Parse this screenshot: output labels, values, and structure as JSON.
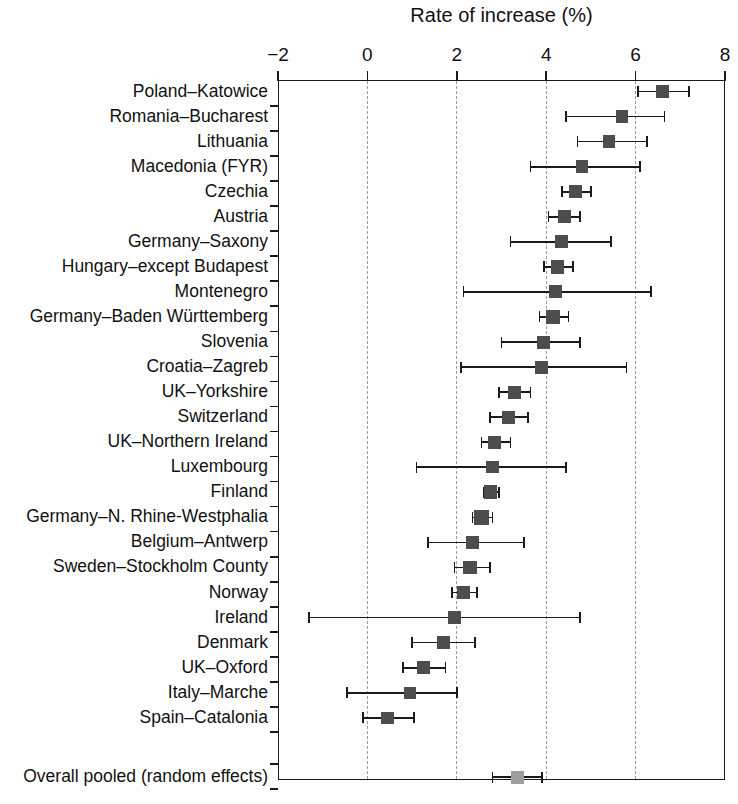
{
  "chart_data": {
    "type": "scatter",
    "subtype": "forest-plot",
    "title": "Rate of increase (%)",
    "xlabel": "Rate of increase (%)",
    "ylabel": "",
    "xlim": [
      -2,
      8
    ],
    "xticks": [
      -2,
      0,
      2,
      4,
      6,
      8
    ],
    "xticklabels": [
      "−2",
      "0",
      "2",
      "4",
      "6",
      "8"
    ],
    "grid": "vertical-dashed",
    "legend": "none",
    "axis_position": "top",
    "categories": [
      "Poland–Katowice",
      "Romania–Bucharest",
      "Lithuania",
      "Macedonia (FYR)",
      "Czechia",
      "Austria",
      "Germany–Saxony",
      "Hungary–except Budapest",
      "Montenegro",
      "Germany–Baden Württemberg",
      "Slovenia",
      "Croatia–Zagreb",
      "UK–Yorkshire",
      "Switzerland",
      "UK–Northern Ireland",
      "Luxembourg",
      "Finland",
      "Germany–N. Rhine-Westphalia",
      "Belgium–Antwerp",
      "Sweden–Stockholm County",
      "Norway",
      "Ireland",
      "Denmark",
      "UK–Oxford",
      "Italy–Marche",
      "Spain–Catalonia"
    ],
    "summary_label": "Overall pooled (random effects)",
    "points": [
      {
        "label": "Poland–Katowice",
        "estimate": 6.6,
        "ci_low": 6.05,
        "ci_high": 7.2,
        "weight": 1.0
      },
      {
        "label": "Romania–Bucharest",
        "estimate": 5.7,
        "ci_low": 4.45,
        "ci_high": 6.65,
        "weight": 0.95
      },
      {
        "label": "Lithuania",
        "estimate": 5.4,
        "ci_low": 4.7,
        "ci_high": 6.25,
        "weight": 0.95
      },
      {
        "label": "Macedonia (FYR)",
        "estimate": 4.8,
        "ci_low": 3.65,
        "ci_high": 6.1,
        "weight": 0.95
      },
      {
        "label": "Czechia",
        "estimate": 4.65,
        "ci_low": 4.35,
        "ci_high": 5.0,
        "weight": 1.0
      },
      {
        "label": "Austria",
        "estimate": 4.4,
        "ci_low": 4.05,
        "ci_high": 4.75,
        "weight": 1.0
      },
      {
        "label": "Germany–Saxony",
        "estimate": 4.35,
        "ci_low": 3.2,
        "ci_high": 5.45,
        "weight": 1.0
      },
      {
        "label": "Hungary–except Budapest",
        "estimate": 4.25,
        "ci_low": 3.95,
        "ci_high": 4.6,
        "weight": 1.05
      },
      {
        "label": "Montenegro",
        "estimate": 4.2,
        "ci_low": 2.15,
        "ci_high": 6.35,
        "weight": 1.0
      },
      {
        "label": "Germany–Baden Württemberg",
        "estimate": 4.15,
        "ci_low": 3.85,
        "ci_high": 4.5,
        "weight": 1.05
      },
      {
        "label": "Slovenia",
        "estimate": 3.95,
        "ci_low": 3.0,
        "ci_high": 4.75,
        "weight": 1.0
      },
      {
        "label": "Croatia–Zagreb",
        "estimate": 3.9,
        "ci_low": 2.1,
        "ci_high": 5.8,
        "weight": 1.0
      },
      {
        "label": "UK–Yorkshire",
        "estimate": 3.3,
        "ci_low": 2.95,
        "ci_high": 3.65,
        "weight": 1.0
      },
      {
        "label": "Switzerland",
        "estimate": 3.15,
        "ci_low": 2.75,
        "ci_high": 3.6,
        "weight": 1.0
      },
      {
        "label": "UK–Northern Ireland",
        "estimate": 2.85,
        "ci_low": 2.55,
        "ci_high": 3.2,
        "weight": 1.0
      },
      {
        "label": "Luxembourg",
        "estimate": 2.8,
        "ci_low": 1.1,
        "ci_high": 4.45,
        "weight": 0.95
      },
      {
        "label": "Finland",
        "estimate": 2.75,
        "ci_low": 2.6,
        "ci_high": 2.95,
        "weight": 1.05
      },
      {
        "label": "Germany–N. Rhine-Westphalia",
        "estimate": 2.55,
        "ci_low": 2.35,
        "ci_high": 2.8,
        "weight": 1.1
      },
      {
        "label": "Belgium–Antwerp",
        "estimate": 2.35,
        "ci_low": 1.35,
        "ci_high": 3.5,
        "weight": 1.05
      },
      {
        "label": "Sweden–Stockholm County",
        "estimate": 2.3,
        "ci_low": 1.95,
        "ci_high": 2.75,
        "weight": 1.05
      },
      {
        "label": "Norway",
        "estimate": 2.15,
        "ci_low": 1.9,
        "ci_high": 2.45,
        "weight": 1.0
      },
      {
        "label": "Ireland",
        "estimate": 1.95,
        "ci_low": -1.3,
        "ci_high": 4.75,
        "weight": 1.05
      },
      {
        "label": "Denmark",
        "estimate": 1.7,
        "ci_low": 1.0,
        "ci_high": 2.4,
        "weight": 1.0
      },
      {
        "label": "UK–Oxford",
        "estimate": 1.25,
        "ci_low": 0.8,
        "ci_high": 1.75,
        "weight": 1.0
      },
      {
        "label": "Italy–Marche",
        "estimate": 0.95,
        "ci_low": -0.45,
        "ci_high": 2.0,
        "weight": 0.95
      },
      {
        "label": "Spain–Catalonia",
        "estimate": 0.45,
        "ci_low": -0.1,
        "ci_high": 1.05,
        "weight": 0.95
      }
    ],
    "summary": {
      "label": "Overall pooled (random effects)",
      "estimate": 3.35,
      "ci_low": 2.8,
      "ci_high": 3.9
    },
    "colors": {
      "marker": "#4d4d4d",
      "summary_marker": "#9e9e9e",
      "axis": "#1a1a1a",
      "grid": "#9a9a9a",
      "background": "#ffffff"
    }
  }
}
